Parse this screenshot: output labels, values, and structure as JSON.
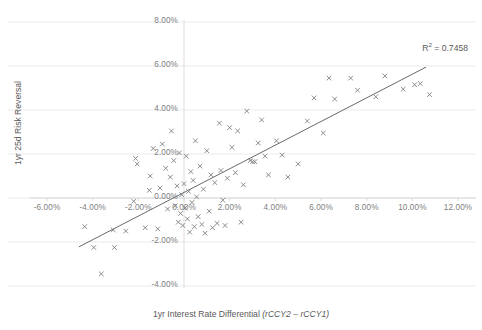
{
  "chart_data": {
    "type": "scatter",
    "title": "",
    "xlabel": "1yr Interest Rate Differential (rCCY2 – rCCY1)",
    "xlabel_plain": "1yr Interest Rate Differential",
    "xlabel_italic": "(rCCY2 – rCCY1)",
    "ylabel": "1yr 25d Risk Reversal",
    "xlim": [
      -6,
      12
    ],
    "ylim": [
      -4,
      8
    ],
    "x_ticks": [
      -6,
      -4,
      -2,
      0,
      2,
      4,
      6,
      8,
      10,
      12
    ],
    "y_ticks": [
      -4,
      -2,
      0,
      2,
      4,
      6,
      8
    ],
    "x_tick_labels": [
      "-6.00%",
      "-4.00%",
      "-2.00%",
      "0.00%",
      "2.00%",
      "4.00%",
      "6.00%",
      "8.00%",
      "10.00%",
      "12.00%"
    ],
    "y_tick_labels": [
      "-4.00%",
      "-2.00%",
      "0.00%",
      "2.00%",
      "4.00%",
      "6.00%",
      "8.00%"
    ],
    "grid": "horizontal",
    "legend": "none",
    "marker": "x",
    "marker_color": "#808080",
    "trendline_color": "#595959",
    "annotations": [
      {
        "name": "r-squared",
        "text": "R² = 0.7458",
        "value": 0.7458
      }
    ],
    "trendline": {
      "x0": -4.6,
      "y0": -2.22,
      "x1": 10.6,
      "y1": 5.95
    },
    "series": [
      {
        "name": "Currency pairs",
        "points": [
          [
            -4.35,
            -1.3
          ],
          [
            -3.95,
            -2.25
          ],
          [
            -3.62,
            -3.45
          ],
          [
            -3.05,
            -2.25
          ],
          [
            -3.1,
            -1.45
          ],
          [
            -2.55,
            -1.5
          ],
          [
            -2.2,
            -0.15
          ],
          [
            -2.12,
            1.8
          ],
          [
            -2.05,
            1.55
          ],
          [
            -1.7,
            -1.35
          ],
          [
            -1.52,
            0.35
          ],
          [
            -1.48,
            1.0
          ],
          [
            -1.35,
            2.25
          ],
          [
            -1.15,
            -1.4
          ],
          [
            -1.05,
            0.45
          ],
          [
            -0.95,
            2.45
          ],
          [
            -0.8,
            1.35
          ],
          [
            -0.72,
            -0.5
          ],
          [
            -0.6,
            0.95
          ],
          [
            -0.55,
            3.05
          ],
          [
            -0.45,
            1.7
          ],
          [
            -0.38,
            -0.35
          ],
          [
            -0.3,
            0.55
          ],
          [
            -0.25,
            -1.1
          ],
          [
            -0.2,
            2.05
          ],
          [
            -0.15,
            -0.7
          ],
          [
            -0.1,
            0.15
          ],
          [
            -0.05,
            -1.25
          ],
          [
            0.0,
            0.65
          ],
          [
            0.05,
            -0.45
          ],
          [
            0.1,
            1.9
          ],
          [
            0.15,
            -0.95
          ],
          [
            0.2,
            0.3
          ],
          [
            0.25,
            -1.55
          ],
          [
            0.3,
            1.2
          ],
          [
            0.35,
            -0.2
          ],
          [
            0.4,
            0.8
          ],
          [
            0.45,
            -1.3
          ],
          [
            0.5,
            2.6
          ],
          [
            0.55,
            0.05
          ],
          [
            0.62,
            -0.85
          ],
          [
            0.7,
            1.45
          ],
          [
            0.78,
            -1.2
          ],
          [
            0.85,
            0.4
          ],
          [
            0.92,
            -1.6
          ],
          [
            1.0,
            2.15
          ],
          [
            1.1,
            -0.6
          ],
          [
            1.18,
            1.05
          ],
          [
            1.25,
            -1.35
          ],
          [
            1.35,
            0.7
          ],
          [
            1.45,
            -1.15
          ],
          [
            1.55,
            3.4
          ],
          [
            1.62,
            1.25
          ],
          [
            1.7,
            -0.1
          ],
          [
            1.8,
            -1.25
          ],
          [
            1.9,
            0.9
          ],
          [
            2.0,
            3.2
          ],
          [
            2.1,
            2.3
          ],
          [
            2.25,
            1.15
          ],
          [
            2.35,
            3.05
          ],
          [
            2.5,
            -1.1
          ],
          [
            2.6,
            0.6
          ],
          [
            2.75,
            3.95
          ],
          [
            2.9,
            1.7
          ],
          [
            3.0,
            1.65
          ],
          [
            3.1,
            1.65
          ],
          [
            3.25,
            2.5
          ],
          [
            3.4,
            3.55
          ],
          [
            3.55,
            1.9
          ],
          [
            3.7,
            1.05
          ],
          [
            4.05,
            2.6
          ],
          [
            4.3,
            1.95
          ],
          [
            4.55,
            0.95
          ],
          [
            5.0,
            1.55
          ],
          [
            5.4,
            3.5
          ],
          [
            5.7,
            4.55
          ],
          [
            6.1,
            2.95
          ],
          [
            6.35,
            5.45
          ],
          [
            6.6,
            4.5
          ],
          [
            7.3,
            5.45
          ],
          [
            7.6,
            4.9
          ],
          [
            8.4,
            4.6
          ],
          [
            8.8,
            5.55
          ],
          [
            9.6,
            4.95
          ],
          [
            10.1,
            5.15
          ],
          [
            10.35,
            5.2
          ],
          [
            10.75,
            4.7
          ]
        ]
      }
    ]
  }
}
